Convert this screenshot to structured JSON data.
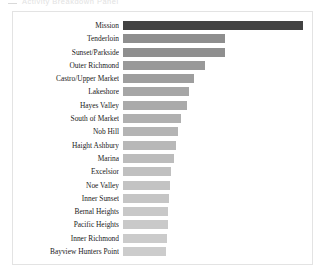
{
  "header": {
    "dash_icon": "menu-dash-icon",
    "clipped_title": "Activity Breakdown Panel"
  },
  "panel": {
    "background": "#ffffff",
    "border_color": "#e3e3e3"
  },
  "chart_data": {
    "type": "bar",
    "orientation": "horizontal",
    "title": "",
    "subtitle": "",
    "xlabel": "",
    "ylabel": "",
    "grid": false,
    "legend": null,
    "axis_visible": false,
    "tick_labels_visible": false,
    "value_labels_visible": false,
    "categories": [
      "Mission",
      "Tenderloin",
      "Sunset/Parkside",
      "Outer Richmond",
      "Castro/Upper Market",
      "Lakeshore",
      "Hayes Valley",
      "South of Market",
      "Nob Hill",
      "Haight Ashbury",
      "Marina",
      "Excelsior",
      "Noe Valley",
      "Inner Sunset",
      "Bernal Heights",
      "Pacific Heights",
      "Inner Richmond",
      "Bayview Hunters Point"
    ],
    "values": [
      180,
      102,
      102,
      82,
      71,
      66,
      64,
      58,
      55,
      53,
      51,
      48,
      47,
      46,
      45,
      45,
      44,
      43
    ],
    "xlim": [
      0,
      185
    ],
    "bar_colors": [
      "#424242",
      "#8e8e8e",
      "#8f8f8f",
      "#999999",
      "#9e9e9e",
      "#a6a6a6",
      "#aaaaaa",
      "#b0b0b0",
      "#b4b4b4",
      "#b8b8b8",
      "#bcbcbc",
      "#c0c0c0",
      "#c3c3c3",
      "#c5c5c5",
      "#c8c8c8",
      "#c9c9c9",
      "#cbcbcb",
      "#cccccc"
    ]
  }
}
